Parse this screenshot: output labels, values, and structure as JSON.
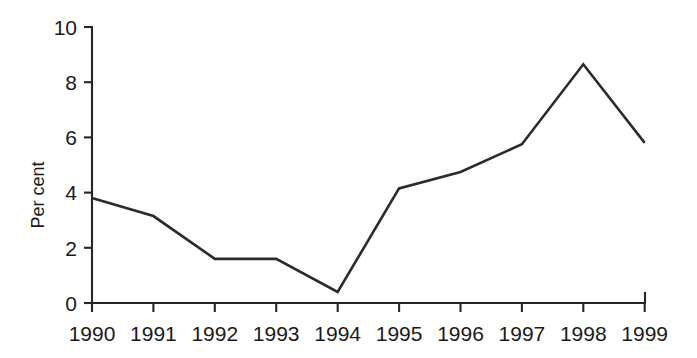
{
  "chart_data": {
    "type": "line",
    "title": "",
    "subtitle": "",
    "xlabel": "",
    "ylabel": "Per cent",
    "categories": [
      "1990",
      "1991",
      "1992",
      "1993",
      "1994",
      "1995",
      "1996",
      "1997",
      "1998",
      "1999"
    ],
    "x": [
      1990,
      1991,
      1992,
      1993,
      1994,
      1995,
      1996,
      1997,
      1998,
      1999
    ],
    "values": [
      3.8,
      3.15,
      1.6,
      1.6,
      0.4,
      4.15,
      4.75,
      5.75,
      8.65,
      5.8
    ],
    "series": [
      {
        "name": "Per cent",
        "values": [
          3.8,
          3.15,
          1.6,
          1.6,
          0.4,
          4.15,
          4.75,
          5.75,
          8.65,
          5.8
        ],
        "color": "#2b2b2b"
      }
    ],
    "ylim": [
      0,
      10
    ],
    "xlim": [
      1990,
      1999
    ],
    "yticks": [
      0,
      2,
      4,
      6,
      8,
      10
    ],
    "ytick_labels": [
      "0",
      "2",
      "4",
      "6",
      "8",
      "10"
    ],
    "xticks": [
      1990,
      1991,
      1992,
      1993,
      1994,
      1995,
      1996,
      1997,
      1998,
      1999
    ],
    "xtick_labels": [
      "1990",
      "1991",
      "1992",
      "1993",
      "1994",
      "1995",
      "1996",
      "1997",
      "1998",
      "1999"
    ],
    "grid": false,
    "legend": false,
    "legend_position": "none",
    "annotations": []
  },
  "axes": {
    "y_title": "Per cent",
    "y_tick_labels": [
      "10",
      "8",
      "6",
      "4",
      "2",
      "0"
    ],
    "x_tick_labels": [
      "1990",
      "1991",
      "1992",
      "1993",
      "1994",
      "1995",
      "1996",
      "1997",
      "1998",
      "1999"
    ]
  },
  "colors": {
    "line": "#2b2b2b",
    "axis": "#262626",
    "text": "#1a1a1a",
    "background": "#ffffff"
  }
}
